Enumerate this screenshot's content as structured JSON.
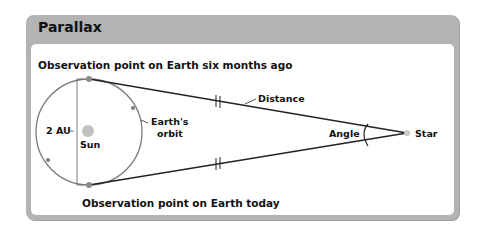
{
  "title": "Parallax",
  "labels": {
    "top_point": "Observation point on Earth six months ago",
    "bottom_point": "Observation point on Earth today",
    "baseline": "2 AU",
    "sun": "Sun",
    "orbit_line1": "Earth's",
    "orbit_line2": "orbit",
    "distance": "Distance",
    "angle": "Angle",
    "star": "Star"
  },
  "colors": {
    "header": "#b3b3b3",
    "orbit": "#777777",
    "sun": "#bdbdbd",
    "line": "#222222"
  }
}
